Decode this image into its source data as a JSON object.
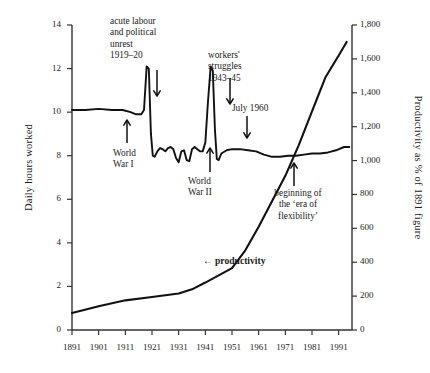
{
  "chart_data": {
    "type": "line",
    "title": "",
    "xlabel": "",
    "ylabel": "Daily hours worked",
    "y2label": "Productivity as % of 1891 figure",
    "xlim": [
      1891,
      1996
    ],
    "ylim": [
      0,
      14
    ],
    "y2lim": [
      0,
      1800
    ],
    "grid": false,
    "legend": "none",
    "xticks": [
      "1891",
      "1901",
      "1911",
      "1921",
      "1931",
      "1941",
      "1951",
      "1961",
      "1971",
      "1981",
      "1991"
    ],
    "xtick_values": [
      1891,
      1901,
      1911,
      1921,
      1931,
      1941,
      1951,
      1961,
      1971,
      1981,
      1991
    ],
    "yticks_left": [
      "0",
      "2",
      "4",
      "6",
      "8",
      "10",
      "12",
      "14"
    ],
    "ytick_left_values": [
      0,
      2,
      4,
      6,
      8,
      10,
      12,
      14
    ],
    "yticks_right": [
      "0",
      "200",
      "400",
      "600",
      "800",
      "1,000",
      "1,200",
      "1,400",
      "1,600",
      "1,800"
    ],
    "ytick_right_values": [
      0,
      200,
      400,
      600,
      800,
      1000,
      1200,
      1400,
      1600,
      1800
    ],
    "series": [
      {
        "name": "Daily hours worked",
        "axis": "left",
        "x": [
          1891,
          1896,
          1901,
          1906,
          1910,
          1913,
          1915,
          1917,
          1918,
          1919,
          1919.8,
          1920.6,
          1921.3,
          1922,
          1923,
          1924,
          1925,
          1926,
          1927,
          1928,
          1929,
          1930,
          1931,
          1932,
          1933,
          1934,
          1935,
          1936,
          1937,
          1938,
          1939,
          1940,
          1941,
          1942,
          1943,
          1943.8,
          1944.6,
          1945.3,
          1946,
          1947,
          1949,
          1951,
          1954,
          1957,
          1960,
          1963,
          1966,
          1969,
          1972,
          1975,
          1978,
          1981,
          1984,
          1987,
          1990,
          1993,
          1995
        ],
        "values": [
          10.1,
          10.1,
          10.15,
          10.1,
          10.1,
          10.0,
          9.9,
          9.9,
          10.1,
          12.1,
          12.0,
          9.0,
          8.0,
          7.95,
          8.2,
          8.35,
          8.3,
          8.2,
          8.35,
          8.4,
          8.3,
          7.9,
          7.7,
          8.2,
          8.25,
          7.8,
          7.75,
          8.3,
          8.4,
          8.3,
          8.2,
          8.2,
          8.6,
          10.5,
          12.1,
          11.9,
          9.2,
          7.85,
          7.8,
          8.1,
          8.25,
          8.3,
          8.3,
          8.25,
          8.2,
          8.05,
          7.95,
          7.95,
          8.0,
          8.0,
          8.05,
          8.1,
          8.1,
          8.15,
          8.25,
          8.4,
          8.4
        ]
      },
      {
        "name": "productivity",
        "axis": "right",
        "x": [
          1891,
          1901,
          1911,
          1921,
          1931,
          1936,
          1941,
          1951,
          1956,
          1961,
          1966,
          1971,
          1976,
          1981,
          1986,
          1991,
          1994
        ],
        "values": [
          100,
          140,
          175,
          195,
          215,
          240,
          280,
          365,
          470,
          610,
          760,
          910,
          1090,
          1290,
          1490,
          1620,
          1700
        ]
      }
    ],
    "annotations": [
      {
        "id": "acute-unrest",
        "text_lines": [
          "acute labour",
          "and political",
          "unrest",
          "1919–20"
        ],
        "arrow": "down",
        "points_to_year": 1920
      },
      {
        "id": "world-war-one",
        "text_lines": [
          "World",
          "War I"
        ],
        "arrow": "up",
        "points_to_year": 1916
      },
      {
        "id": "workers-struggles",
        "text_lines": [
          "workers'",
          "struggles",
          "1943–45"
        ],
        "arrow": "down",
        "points_to_year": 1944
      },
      {
        "id": "world-war-two",
        "text_lines": [
          "World",
          "War II"
        ],
        "arrow": "up",
        "points_to_year": 1942
      },
      {
        "id": "july-1960",
        "text_lines": [
          "July  1960"
        ],
        "arrow": "down",
        "points_to_year": 1960
      },
      {
        "id": "era-of-flexibility",
        "text_lines": [
          "beginning of",
          "the ‘era of",
          "flexibility’"
        ],
        "arrow": "up",
        "points_to_year": 1976
      },
      {
        "id": "productivity-label",
        "text_lines": [
          "←  productivity"
        ],
        "arrow": "left-inline",
        "points_to_year": 1959
      }
    ]
  },
  "axes": {
    "left_title": "Daily hours worked",
    "right_title": "Productivity as % of 1891 figure"
  },
  "annotations": {
    "acute_unrest": {
      "line1": "acute labour",
      "line2": "and political",
      "line3": "unrest",
      "line4": "1919–20"
    },
    "world_war_one": {
      "line1": "World",
      "line2": "War I"
    },
    "workers_struggles": {
      "line1": "workers'",
      "line2": "struggles",
      "line3": "1943–45"
    },
    "world_war_two": {
      "line1": "World",
      "line2": "War II"
    },
    "july_1960": {
      "line1": "July  1960"
    },
    "era_of_flexibility": {
      "line1": "beginning of",
      "line2": "the ‘era of",
      "line3": "flexibility’"
    },
    "productivity_label": {
      "line1": "←  productivity"
    }
  },
  "style": {
    "line_color": "#111111",
    "axis_color": "#333333",
    "text_color": "#1a1a1a",
    "background": "#ffffff"
  }
}
